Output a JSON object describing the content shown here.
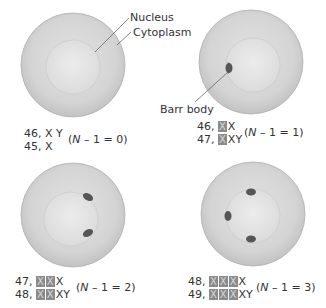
{
  "labels": {
    "nucleus": "Nucleus",
    "cytoplasm": "Cytoplasm",
    "barr_body": "Barr body"
  },
  "colors": {
    "cytoplasm": "#d6d6d6",
    "cytoplasm_edge": "#a8a8a8",
    "nucleus": "#e4e4e4",
    "barr_body": "#555555",
    "inactive_x_box": "#8a8a8a"
  },
  "panels": [
    {
      "id": "panel-0",
      "karyotypes": [
        {
          "count": "46,",
          "inactive": [],
          "active": "X Y"
        },
        {
          "count": "45,",
          "inactive": [],
          "active": "X"
        }
      ],
      "formula_n": "N",
      "formula_rest": " – 1 = 0)",
      "barr_bodies": 0
    },
    {
      "id": "panel-1",
      "karyotypes": [
        {
          "count": "46,",
          "inactive": [
            "X"
          ],
          "active": "X"
        },
        {
          "count": "47,",
          "inactive": [
            "X"
          ],
          "active": "XY"
        }
      ],
      "formula_n": "N",
      "formula_rest": " – 1 = 1)",
      "barr_bodies": 1
    },
    {
      "id": "panel-2",
      "karyotypes": [
        {
          "count": "47,",
          "inactive": [
            "X",
            "X"
          ],
          "active": "X"
        },
        {
          "count": "48,",
          "inactive": [
            "X",
            "X"
          ],
          "active": "XY"
        }
      ],
      "formula_n": "N",
      "formula_rest": " – 1 = 2)",
      "barr_bodies": 2
    },
    {
      "id": "panel-3",
      "karyotypes": [
        {
          "count": "48,",
          "inactive": [
            "X",
            "X",
            "X"
          ],
          "active": "X"
        },
        {
          "count": "49,",
          "inactive": [
            "X",
            "X",
            "X"
          ],
          "active": "XY"
        }
      ],
      "formula_n": "N",
      "formula_rest": " – 1 = 3)",
      "barr_bodies": 3
    }
  ]
}
